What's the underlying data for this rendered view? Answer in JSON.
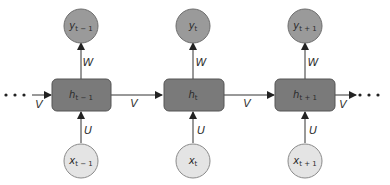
{
  "diagram": {
    "type": "unrolled-rnn",
    "colors": {
      "hidden_fill": "#7a7a7a",
      "hidden_stroke": "#555555",
      "output_fill": "#9a9a9a",
      "output_stroke": "#6e6e6e",
      "input_fill": "#e4e4e4",
      "input_stroke": "#8a8a8a",
      "edge": "#333333"
    },
    "steps": [
      {
        "hidden": {
          "base": "h",
          "sub": "t − 1"
        },
        "output": {
          "base": "y",
          "sub": "t − 1"
        },
        "input": {
          "base": "x",
          "sub": "t − 1"
        },
        "w_label": "W",
        "u_label": "U"
      },
      {
        "hidden": {
          "base": "h",
          "sub": "t"
        },
        "output": {
          "base": "y",
          "sub": "t"
        },
        "input": {
          "base": "x",
          "sub": "t"
        },
        "w_label": "W",
        "u_label": "U"
      },
      {
        "hidden": {
          "base": "h",
          "sub": "t + 1"
        },
        "output": {
          "base": "y",
          "sub": "t + 1"
        },
        "input": {
          "base": "x",
          "sub": "t + 1"
        },
        "w_label": "W",
        "u_label": "U"
      }
    ],
    "recurrent_edges": [
      {
        "from": "start",
        "to": "h_t-1",
        "label": "V"
      },
      {
        "from": "h_t-1",
        "to": "h_t",
        "label": "V"
      },
      {
        "from": "h_t",
        "to": "h_t+1",
        "label": "V"
      },
      {
        "from": "h_t+1",
        "to": "end",
        "label": "V"
      }
    ],
    "ellipsis_left": "• • •",
    "ellipsis_right": "• • •"
  }
}
